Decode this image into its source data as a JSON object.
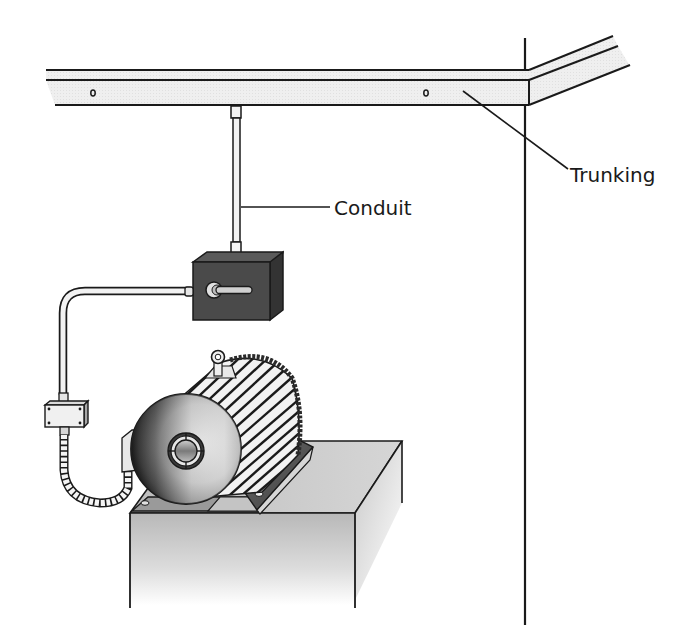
{
  "diagram": {
    "labels": {
      "trunking": "Trunking",
      "conduit": "Conduit"
    },
    "components": [
      "trunking",
      "wall",
      "conduit",
      "isolator-switch",
      "rigid-conduit-bend",
      "junction-box",
      "flexible-conduit",
      "motor",
      "motor-terminal-box",
      "motor-feet",
      "plinth"
    ],
    "colors": {
      "line": "#1a1a1a",
      "trunking_fill": "#ececec",
      "switch_body": "#4a4a4a",
      "switch_top": "#5a5a5a",
      "switch_side": "#333333",
      "plinth_top": "#bdbdbd",
      "plinth_front": "#c4c4c4",
      "conduit_fill": "#f2f2f2"
    }
  }
}
